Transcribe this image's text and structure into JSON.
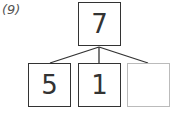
{
  "label": "(9)",
  "whole": {
    "value": "7"
  },
  "parts": [
    {
      "value": "5"
    },
    {
      "value": "1"
    },
    {
      "value": ""
    }
  ],
  "colors": {
    "line": "#333333",
    "empty_box": "#bbbbbb"
  }
}
